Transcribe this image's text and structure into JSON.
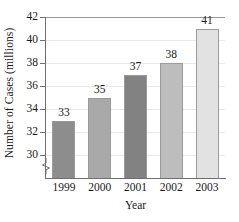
{
  "chart_data": {
    "type": "bar",
    "title": "",
    "xlabel": "Year",
    "ylabel": "Number of Cases (millions)",
    "categories": [
      "1999",
      "2000",
      "2001",
      "2002",
      "2003"
    ],
    "values": [
      33,
      35,
      37,
      38,
      41
    ],
    "value_labels": [
      "33",
      "35",
      "37",
      "38",
      "41"
    ],
    "ylim": [
      28,
      42
    ],
    "yticks": [
      30,
      32,
      34,
      36,
      38,
      40,
      42
    ],
    "ytick_labels": [
      "30",
      "32",
      "34",
      "36",
      "38",
      "40",
      "42"
    ],
    "grid": true,
    "grid_axis": "y",
    "legend": "none",
    "axis_break": true,
    "axis_break_note": "y-axis broken below 30",
    "bar_colors": [
      "#8d8d8d",
      "#a9a9a9",
      "#828282",
      "#bdbdbd",
      "#e2e2e2"
    ],
    "bar_edge_color": "#9a9a9a",
    "axis_color": "#6f6f6f",
    "grid_color": "#e9e9e9",
    "background": "#ffffff",
    "text_color": "#1a1a1a"
  }
}
